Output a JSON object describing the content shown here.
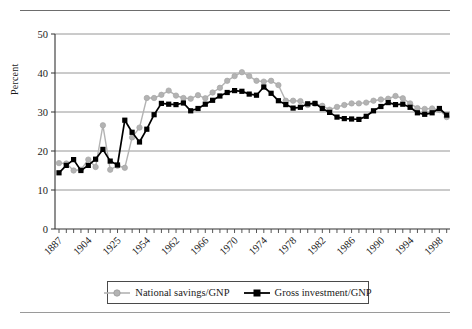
{
  "chart_data": {
    "type": "line",
    "title": "",
    "xlabel": "",
    "ylabel": "Percent",
    "ylim": [
      0,
      50
    ],
    "yticks": [
      0,
      10,
      20,
      30,
      40,
      50
    ],
    "grid": true,
    "legend_position": "bottom",
    "tick_labels": [
      "1887",
      "1904",
      "1925",
      "1954",
      "1962",
      "1966",
      "1970",
      "1974",
      "1978",
      "1982",
      "1986",
      "1990",
      "1994",
      "1998"
    ],
    "tick_label_every": 4,
    "n_points": 54,
    "series": [
      {
        "name": "National savings/GNP",
        "color": "#b3b3b3",
        "marker": "circle",
        "values": [
          16.9,
          16.8,
          15.0,
          15.2,
          17.8,
          15.9,
          26.6,
          15.2,
          16.2,
          15.7,
          23.5,
          26.0,
          33.6,
          33.6,
          34.4,
          35.5,
          34.2,
          33.6,
          33.4,
          34.3,
          33.5,
          35.0,
          36.2,
          38.0,
          39.2,
          40.2,
          39.2,
          38.0,
          37.8,
          38.0,
          36.9,
          32.9,
          32.9,
          32.8,
          31.8,
          32.1,
          31.6,
          30.6,
          31.3,
          31.8,
          32.2,
          32.2,
          32.4,
          32.9,
          33.2,
          33.4,
          34.1,
          33.5,
          32.2,
          31.0,
          30.8,
          30.9,
          30.5,
          28.7
        ]
      },
      {
        "name": "Gross investment/GNP",
        "color": "#000000",
        "marker": "square",
        "values": [
          14.4,
          16.3,
          17.8,
          15.0,
          16.3,
          17.9,
          20.4,
          17.4,
          16.4,
          27.9,
          24.8,
          22.3,
          25.6,
          29.3,
          32.2,
          32.0,
          31.9,
          32.3,
          30.3,
          30.9,
          32.0,
          33.0,
          34.1,
          35.0,
          35.5,
          35.3,
          34.6,
          34.3,
          36.4,
          34.8,
          32.9,
          31.9,
          31.0,
          31.2,
          32.1,
          32.2,
          30.9,
          29.9,
          28.7,
          28.3,
          28.2,
          28.1,
          28.9,
          30.3,
          31.4,
          32.4,
          31.9,
          32.0,
          31.2,
          29.8,
          29.4,
          29.8,
          30.9,
          29.2
        ]
      }
    ]
  },
  "legend": {
    "items": [
      {
        "label": "National savings/GNP"
      },
      {
        "label": "Gross investment/GNP"
      }
    ]
  }
}
